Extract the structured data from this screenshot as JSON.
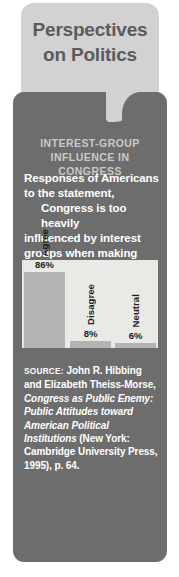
{
  "header": {
    "title_line1": "Perspectives",
    "title_line2": "on Politics"
  },
  "subtitle": {
    "line1": "INTEREST-GROUP",
    "line2": "INFLUENCE IN CONGRESS"
  },
  "lede": {
    "line1": "Responses of Americans to",
    "line2": "the statement,",
    "quote_line1": "Congress is too heavily",
    "quote_line2": "influenced by interest groups",
    "quote_line3": "when making decisions."
  },
  "source": {
    "label": "SOURCE:",
    "authors": " John R. Hibbing and Elizabeth Theiss-Morse, ",
    "title_italic": "Congress as Public Enemy: Public Attitudes toward American Political Institutions",
    "publisher": " (New York: Cambridge University Press, 1995), p. 64."
  },
  "colors": {
    "panel_dark": "#6d6d6d",
    "panel_light": "#d2d2d2",
    "plot_background": "#e9e9e5",
    "bar_fill": "#b4b4b4",
    "title_text": "#5b5b5b",
    "subtitle_text": "#c9c9c9",
    "body_text": "#ffffff",
    "chart_text": "#1d1d1d"
  },
  "chart_data": {
    "type": "bar",
    "title": "INTEREST-GROUP INFLUENCE IN CONGRESS",
    "xlabel": "",
    "ylabel": "",
    "ylim": [
      0,
      100
    ],
    "grid": false,
    "legend": "none",
    "categories": [
      "Agree",
      "Disagree",
      "Neutral"
    ],
    "values": [
      86,
      8,
      6
    ],
    "value_labels": [
      "86%",
      "8%",
      "6%"
    ],
    "units": "percent"
  }
}
